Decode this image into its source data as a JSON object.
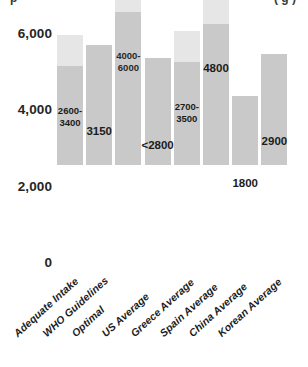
{
  "title_fragment": {
    "left": "p",
    "right": "( g )"
  },
  "chart_data": {
    "type": "bar",
    "title": "",
    "xlabel": "",
    "ylabel": "",
    "ylim": [
      0,
      6500
    ],
    "grid": false,
    "legend": "none",
    "yticks": [
      0,
      2000,
      4000,
      6000
    ],
    "ytick_labels": [
      "0",
      "2,000",
      "4,000",
      "6,000"
    ],
    "categories": [
      "Adequate Intake",
      "WHO Guidelines",
      "Optimal",
      "US Average",
      "Greece Average",
      "Spain Average",
      "China Average",
      "Korean Average"
    ],
    "bars": [
      {
        "category": "Adequate Intake",
        "label": "2600-\n3400",
        "label_position": "above",
        "range_low": 2600,
        "range_high": 3400,
        "value": 3400,
        "two_tone": true
      },
      {
        "category": "WHO Guidelines",
        "label": "3150",
        "label_position": "above",
        "range_low": 3150,
        "range_high": 3150,
        "value": 3150,
        "two_tone": false
      },
      {
        "category": "Optimal",
        "label": "4000-\n6000",
        "label_position": "inside",
        "range_low": 4000,
        "range_high": 6000,
        "value": 6000,
        "two_tone": true
      },
      {
        "category": "US Average",
        "label": "<2800",
        "label_position": "above",
        "range_low": 2800,
        "range_high": 2800,
        "value": 2800,
        "two_tone": false
      },
      {
        "category": "Greece Average",
        "label": "2700-\n3500",
        "label_position": "above",
        "range_low": 2700,
        "range_high": 3500,
        "value": 3500,
        "two_tone": true
      },
      {
        "category": "Spain Average",
        "label": "4800",
        "label_position": "above",
        "range_low": 3700,
        "range_high": 4800,
        "value": 4800,
        "two_tone": true
      },
      {
        "category": "China Average",
        "label": "1800",
        "label_position": "above",
        "range_low": 1800,
        "range_high": 1800,
        "value": 1800,
        "two_tone": false
      },
      {
        "category": "Korean Average",
        "label": "2900",
        "label_position": "above",
        "range_low": 2900,
        "range_high": 2900,
        "value": 2900,
        "two_tone": false
      }
    ],
    "colors": {
      "bar_low": "#c9c9c9",
      "bar_high": "#e6e6e6",
      "text": "#1c1c1c",
      "background": "#ffffff"
    }
  }
}
